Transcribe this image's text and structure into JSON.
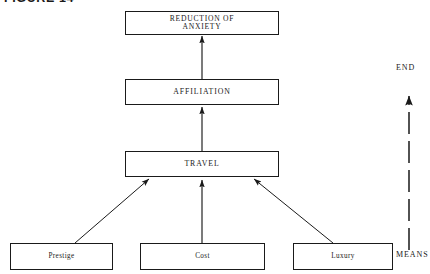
{
  "figure": {
    "caption": "FIGURE 14",
    "background_color": "#ffffff",
    "line_color": "#1a1a1a"
  },
  "diagram": {
    "type": "means-end-chain-hierarchy",
    "nodes": [
      {
        "id": "goal",
        "label": "REDUCTION OF\nANXIETY",
        "level": "end",
        "x": 125,
        "y": 11,
        "w": 154,
        "h": 24
      },
      {
        "id": "affiliation",
        "label": "AFFILIATION",
        "level": "intermediate",
        "x": 125,
        "y": 79,
        "w": 154,
        "h": 26
      },
      {
        "id": "travel",
        "label": "TRAVEL",
        "level": "intermediate",
        "x": 125,
        "y": 151,
        "w": 154,
        "h": 26
      },
      {
        "id": "prestige",
        "label": "Prestige",
        "level": "means",
        "x": 10,
        "y": 243,
        "w": 103,
        "h": 27
      },
      {
        "id": "cost",
        "label": "Cost",
        "level": "means",
        "x": 140,
        "y": 243,
        "w": 125,
        "h": 27
      },
      {
        "id": "luxury",
        "label": "Luxury",
        "level": "means",
        "x": 293,
        "y": 243,
        "w": 100,
        "h": 27
      }
    ],
    "edges": [
      {
        "from": "affiliation",
        "to": "goal",
        "style": "solid",
        "arrow": "up"
      },
      {
        "from": "travel",
        "to": "affiliation",
        "style": "solid",
        "arrow": "up"
      },
      {
        "from": "cost",
        "to": "travel",
        "style": "solid",
        "arrow": "up"
      },
      {
        "from": "prestige",
        "to": "travel",
        "style": "solid",
        "arrow": "diagonal-up-right"
      },
      {
        "from": "luxury",
        "to": "travel",
        "style": "solid",
        "arrow": "diagonal-up-left"
      }
    ],
    "axis": {
      "top_label": "END",
      "bottom_label": "MEANS",
      "line_style": "dashed",
      "arrow": "up"
    }
  }
}
